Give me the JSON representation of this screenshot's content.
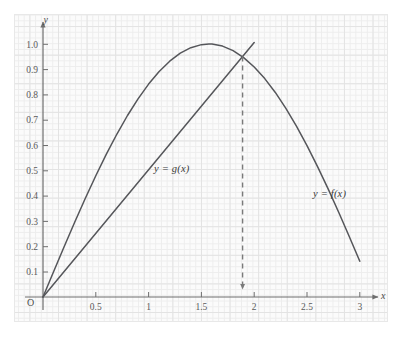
{
  "chart_data": {
    "type": "line",
    "title": "",
    "xlabel": "x",
    "ylabel": "y",
    "origin_label": "O",
    "xlim": [
      0,
      3.2
    ],
    "ylim": [
      0,
      1.08
    ],
    "grid": true,
    "legend_position": "inline-annotations",
    "x_ticks": [
      "0.5",
      "1",
      "1.5",
      "2",
      "2.5",
      "3"
    ],
    "x_tick_values": [
      0.5,
      1,
      1.5,
      2,
      2.5,
      3
    ],
    "y_ticks": [
      "0.1",
      "0.2",
      "0.3",
      "0.4",
      "0.5",
      "0.6",
      "0.7",
      "0.8",
      "0.9",
      "1.0"
    ],
    "y_tick_values": [
      0.1,
      0.2,
      0.3,
      0.4,
      0.5,
      0.6,
      0.7,
      0.8,
      0.9,
      1.0
    ],
    "series": [
      {
        "name": "y = f(x)",
        "label": "y = f(x)",
        "kind": "curve",
        "description": "sine-like arch from origin, peak 1.0 near x=1.57, ends near (3, 0.14)",
        "x": [
          0,
          0.1,
          0.2,
          0.3,
          0.4,
          0.5,
          0.6,
          0.7,
          0.8,
          0.9,
          1.0,
          1.1,
          1.2,
          1.3,
          1.4,
          1.5,
          1.5708,
          1.6,
          1.7,
          1.8,
          1.9,
          2.0,
          2.1,
          2.2,
          2.3,
          2.4,
          2.5,
          2.6,
          2.7,
          2.8,
          2.9,
          3.0
        ],
        "y": [
          0,
          0.0998,
          0.1987,
          0.2955,
          0.3894,
          0.4794,
          0.5646,
          0.6442,
          0.7174,
          0.7833,
          0.8415,
          0.8912,
          0.932,
          0.9636,
          0.9854,
          0.9975,
          1.0,
          0.9996,
          0.9917,
          0.9738,
          0.9463,
          0.9093,
          0.8632,
          0.8085,
          0.7457,
          0.6755,
          0.5985,
          0.5155,
          0.4274,
          0.335,
          0.2392,
          0.1411
        ]
      },
      {
        "name": "y = g(x)",
        "label": "y = g(x)",
        "kind": "line",
        "description": "straight line through origin, slope about 0.503, drawn to about x=2.0",
        "x": [
          0,
          2.0
        ],
        "y": [
          0,
          1.006
        ]
      }
    ],
    "annotations": [
      {
        "name": "intersection-drop-line",
        "style": "dashed-vertical-with-down-arrow",
        "x": 1.89,
        "y_top": 0.951,
        "y_bottom": 0.0
      }
    ]
  },
  "labels": {
    "y_axis": "y",
    "x_axis": "x",
    "origin": "O",
    "curve_f": "y = f(x)",
    "curve_g": "y = g(x)"
  },
  "colors": {
    "curve": "#55565a",
    "axis": "#6e6e6e",
    "grid_minor": "#ededed",
    "grid_major": "#e3e3e3",
    "panel_background": "#fbfbfb",
    "tick_text": "#5a5a5a",
    "dashed": "#7a7a7a"
  }
}
